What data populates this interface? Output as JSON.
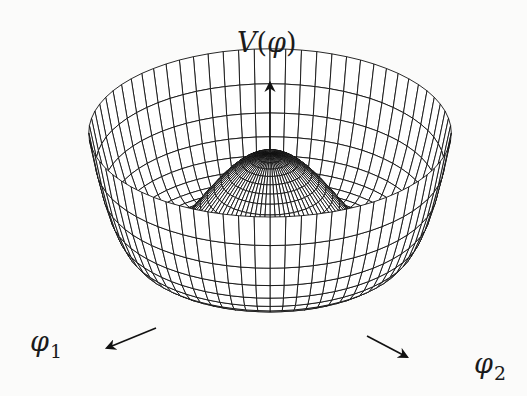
{
  "figure": {
    "axes": {
      "vertical": {
        "symbol": "V",
        "argument": "φ",
        "open": "(",
        "close": ")"
      },
      "phi1": {
        "symbol": "φ",
        "subscript": "1"
      },
      "phi2": {
        "symbol": "φ",
        "subscript": "2"
      }
    },
    "colors": {
      "background": "#fbfbfa",
      "ink": "#111111",
      "surface_fill": "#ffffff"
    },
    "surface": {
      "radial_lines": 72,
      "ring_lines": 26,
      "max_radius": 1.45
    }
  }
}
